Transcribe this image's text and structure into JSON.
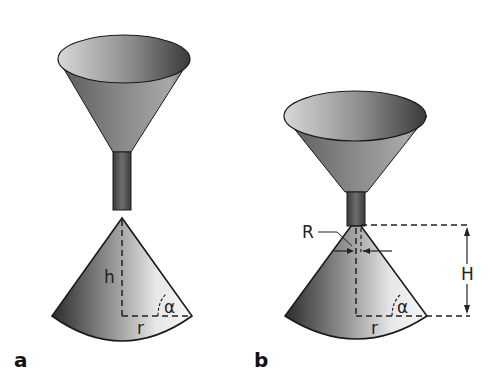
{
  "figure": {
    "panels": [
      {
        "id": "a",
        "label": "a",
        "symbols": {
          "height": "h",
          "radius": "r",
          "angle": "α"
        }
      },
      {
        "id": "b",
        "label": "b",
        "symbols": {
          "outlet_radius": "R",
          "height": "H",
          "radius": "r",
          "angle": "α"
        }
      }
    ],
    "colors": {
      "dark": "#2a2a2a",
      "light": "#f2f2f2",
      "outline": "#1a1a1a",
      "background": "#ffffff"
    }
  }
}
